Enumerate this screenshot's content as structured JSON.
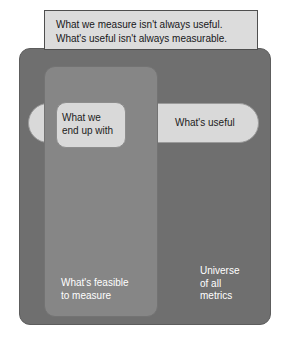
{
  "diagram": {
    "caption": "What we measure isn't always useful.\nWhat's useful isn't always measurable.",
    "regions": {
      "universe": {
        "label": "Universe\nof all\nmetrics",
        "fill": "#6f6f6f",
        "text_color": "#ffffff"
      },
      "feasible": {
        "label": "What's feasible\nto measure",
        "fill": "#868686",
        "text_color": "#ffffff"
      },
      "useful": {
        "label": "What's useful",
        "fill": "#d9d9d9",
        "text_color": "#1c1c1c"
      },
      "end_up_with": {
        "label": "What we\nend up with",
        "fill": "#d9d9d9",
        "text_color": "#1c1c1c"
      }
    },
    "banner": {
      "fill": "#dcdcdc",
      "border": "#4f4f4f",
      "text_color": "#17171a"
    }
  }
}
